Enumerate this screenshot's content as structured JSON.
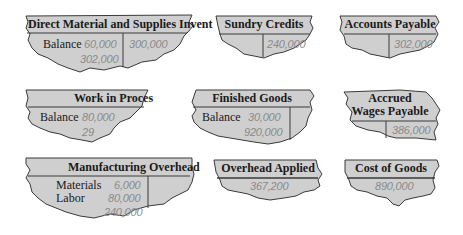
{
  "colors": {
    "fill": "#cfcfcf",
    "stroke": "#3a3a3a",
    "value_text": "#8a8a8a",
    "label_text": "#1a1a1a"
  },
  "accounts": {
    "direct_material": {
      "title": "Direct Material and Supplies Invent",
      "debit": {
        "label": "Balance",
        "values": [
          "60,000",
          "302,000"
        ]
      },
      "credit": {
        "values": [
          "300,000"
        ]
      }
    },
    "sundry_credits": {
      "title": "Sundry Credits",
      "debit": {
        "values": []
      },
      "credit": {
        "values": [
          "240,000"
        ]
      }
    },
    "accounts_payable": {
      "title": "Accounts Payable",
      "debit": {
        "values": []
      },
      "credit": {
        "values": [
          "302,000"
        ]
      }
    },
    "work_in_process": {
      "title": "Work in Proces",
      "debit": {
        "label": "Balance",
        "values": [
          "80,000",
          "29"
        ]
      },
      "credit": {
        "values": []
      }
    },
    "finished_goods": {
      "title": "Finished Goods",
      "debit": {
        "label": "Balance",
        "values": [
          "30,000",
          "920,000"
        ]
      },
      "credit": {
        "values": []
      }
    },
    "accrued_wages": {
      "title_line1": "Accrued",
      "title_line2": "Wages Payable",
      "debit": {
        "values": []
      },
      "credit": {
        "values": [
          "386,000"
        ]
      }
    },
    "manufacturing_overhead": {
      "title": "Manufacturing Overhead",
      "debit": {
        "labels": [
          "Materials",
          "Labor"
        ],
        "values": [
          "6,000",
          "80,000",
          "240,000"
        ]
      },
      "credit": {
        "values": []
      }
    },
    "overhead_applied": {
      "title": "Overhead Applied",
      "values": [
        "367,200"
      ]
    },
    "cost_of_goods": {
      "title": "Cost of Goods",
      "values": [
        "890,000"
      ]
    }
  }
}
